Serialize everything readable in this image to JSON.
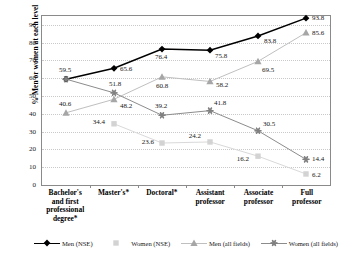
{
  "chart_data": {
    "type": "line",
    "title": "",
    "xlabel": "",
    "ylabel": "% Men or women at each level",
    "ylim": [
      0,
      95
    ],
    "yticks": [
      0,
      10,
      20,
      30,
      40,
      50,
      60,
      70,
      80,
      90
    ],
    "grid": true,
    "legend_position": "bottom",
    "categories": [
      "Bachelor's and first professional degree*",
      "Master's*",
      "Doctoral*",
      "Assistant professor",
      "Associate professor",
      "Full professor"
    ],
    "series": [
      {
        "name": "Men (NSE)",
        "marker": "diamond",
        "color": "#000000",
        "line_color": "#000000",
        "values": [
          59.5,
          65.6,
          76.4,
          75.8,
          83.8,
          93.8
        ]
      },
      {
        "name": "Women (NSE)",
        "marker": "square",
        "color": "#d3d3d3",
        "line_color": "#d9d9d9",
        "values": [
          null,
          34.4,
          23.6,
          24.2,
          16.2,
          6.2
        ]
      },
      {
        "name": "Men (all fields)",
        "marker": "triangle",
        "color": "#a6a6a6",
        "line_color": "#bfbfbf",
        "values": [
          40.6,
          48.2,
          60.8,
          58.2,
          69.5,
          85.6
        ]
      },
      {
        "name": "Women (all fields)",
        "marker": "asterisk",
        "color": "#808080",
        "line_color": "#8c8c8c",
        "values": [
          59.5,
          51.8,
          39.2,
          41.8,
          30.5,
          14.4
        ]
      }
    ],
    "point_labels": [
      {
        "series": 0,
        "index": 0,
        "text": "59.5",
        "dx": -1,
        "dy": -9,
        "align": "center"
      },
      {
        "series": 0,
        "index": 1,
        "text": "65.6",
        "dx": 6,
        "dy": 1,
        "align": "left"
      },
      {
        "series": 0,
        "index": 2,
        "text": "76.4",
        "dx": -1,
        "dy": 8,
        "align": "center"
      },
      {
        "series": 0,
        "index": 3,
        "text": "75.8",
        "dx": 5,
        "dy": 6,
        "align": "left"
      },
      {
        "series": 0,
        "index": 4,
        "text": "83.8",
        "dx": 6,
        "dy": 5,
        "align": "left"
      },
      {
        "series": 0,
        "index": 5,
        "text": "93.8",
        "dx": 6,
        "dy": 0,
        "align": "left"
      },
      {
        "series": 1,
        "index": 1,
        "text": "34.4",
        "dx": -9,
        "dy": -2,
        "align": "right"
      },
      {
        "series": 1,
        "index": 2,
        "text": "23.6",
        "dx": -8,
        "dy": -1,
        "align": "right"
      },
      {
        "series": 1,
        "index": 3,
        "text": "24.2",
        "dx": -9,
        "dy": -6,
        "align": "right"
      },
      {
        "series": 1,
        "index": 4,
        "text": "16.2",
        "dx": -9,
        "dy": 3,
        "align": "right"
      },
      {
        "series": 1,
        "index": 5,
        "text": "6.2",
        "dx": 6,
        "dy": 1,
        "align": "left"
      },
      {
        "series": 2,
        "index": 0,
        "text": "40.6",
        "dx": -1,
        "dy": -9,
        "align": "center"
      },
      {
        "series": 2,
        "index": 1,
        "text": "48.2",
        "dx": 6,
        "dy": 7,
        "align": "left"
      },
      {
        "series": 2,
        "index": 2,
        "text": "60.8",
        "dx": 0,
        "dy": 9,
        "align": "center"
      },
      {
        "series": 2,
        "index": 3,
        "text": "58.2",
        "dx": 6,
        "dy": 4,
        "align": "left"
      },
      {
        "series": 2,
        "index": 4,
        "text": "69.5",
        "dx": 4,
        "dy": 9,
        "align": "left"
      },
      {
        "series": 2,
        "index": 5,
        "text": "85.6",
        "dx": 6,
        "dy": 0,
        "align": "left"
      },
      {
        "series": 3,
        "index": 1,
        "text": "51.8",
        "dx": 1,
        "dy": -9,
        "align": "center"
      },
      {
        "series": 3,
        "index": 2,
        "text": "39.2",
        "dx": -1,
        "dy": -9,
        "align": "center"
      },
      {
        "series": 3,
        "index": 3,
        "text": "41.8",
        "dx": 4,
        "dy": -8,
        "align": "left"
      },
      {
        "series": 3,
        "index": 4,
        "text": "30.5",
        "dx": 5,
        "dy": -7,
        "align": "left"
      },
      {
        "series": 3,
        "index": 5,
        "text": "14.4",
        "dx": 6,
        "dy": 0,
        "align": "left"
      }
    ]
  }
}
